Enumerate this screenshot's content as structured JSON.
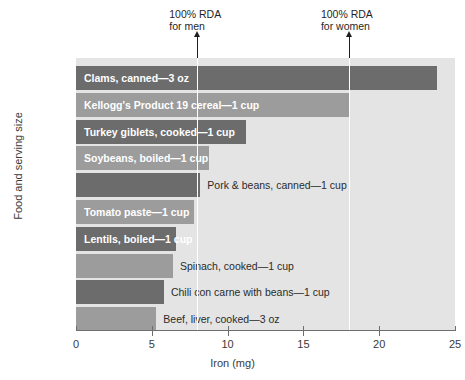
{
  "chart_data": {
    "type": "bar",
    "orientation": "horizontal",
    "title": "",
    "xlabel": "Iron (mg)",
    "ylabel": "Food and serving size",
    "xlim": [
      0,
      25
    ],
    "xticks": [
      "0",
      "5",
      "10",
      "15",
      "20",
      "25"
    ],
    "grid": false,
    "legend": "none",
    "categories": [
      "Clams, canned—3 oz",
      "Kellogg's Product 19 cereal—1 cup",
      "Turkey giblets, cooked—1 cup",
      "Soybeans, boiled—1 cup",
      "Pork & beans, canned—1 cup",
      "Tomato paste—1 cup",
      "Lentils, boiled—1 cup",
      "Spinach, cooked—1 cup",
      "Chili con carne with beans—1 cup",
      "Beef, liver, cooked—3 oz"
    ],
    "values": [
      23.8,
      18.0,
      11.2,
      8.8,
      8.2,
      7.8,
      6.6,
      6.4,
      5.8,
      5.3
    ],
    "bars": [
      {
        "label": "Clams, canned—3 oz",
        "value": 23.8,
        "shade": "dark",
        "label_position": "inside"
      },
      {
        "label": "Kellogg's Product 19 cereal—1 cup",
        "value": 18.0,
        "shade": "mid",
        "label_position": "inside"
      },
      {
        "label": "Turkey giblets, cooked—1 cup",
        "value": 11.2,
        "shade": "dark",
        "label_position": "inside"
      },
      {
        "label": "Soybeans, boiled—1 cup",
        "value": 8.8,
        "shade": "mid",
        "label_position": "inside"
      },
      {
        "label": "Pork & beans, canned—1 cup",
        "value": 8.2,
        "shade": "dark",
        "label_position": "outside"
      },
      {
        "label": "Tomato paste—1 cup",
        "value": 7.8,
        "shade": "mid",
        "label_position": "inside"
      },
      {
        "label": "Lentils, boiled—1 cup",
        "value": 6.6,
        "shade": "dark",
        "label_position": "inside"
      },
      {
        "label": "Spinach, cooked—1 cup",
        "value": 6.4,
        "shade": "mid",
        "label_position": "outside"
      },
      {
        "label": "Chili con carne with beans—1 cup",
        "value": 5.8,
        "shade": "dark",
        "label_position": "outside"
      },
      {
        "label": "Beef, liver, cooked—3 oz",
        "value": 5.3,
        "shade": "mid",
        "label_position": "outside"
      }
    ],
    "annotations": [
      {
        "name": "rda-men",
        "line1": "100% RDA",
        "line2": "for men",
        "value": 8.0
      },
      {
        "name": "rda-women",
        "line1": "100% RDA",
        "line2": "for women",
        "value": 18.0
      }
    ],
    "colors": {
      "bar_dark": "#6c6c6c",
      "bar_mid": "#9c9c9c",
      "plot_background": "#e4e4e4",
      "axis": "#6e6e6e",
      "text": "#2b2b2b",
      "rda_marker": "#1f1f1f"
    }
  }
}
